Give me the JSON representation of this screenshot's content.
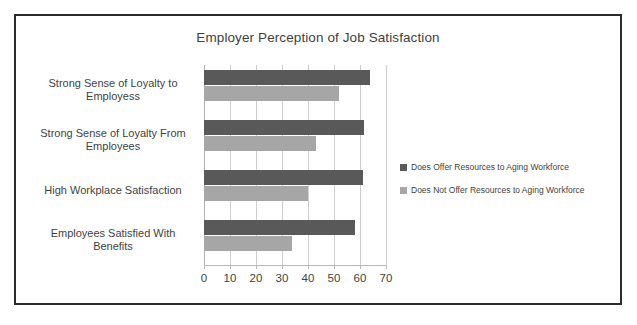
{
  "chart_data": {
    "type": "bar",
    "orientation": "horizontal",
    "title": "Employer Perception of Job Satisfaction",
    "xlabel": "",
    "ylabel": "",
    "xlim": [
      0,
      70
    ],
    "xticks": [
      "0",
      "10",
      "20",
      "30",
      "40",
      "50",
      "60",
      "70"
    ],
    "grid": true,
    "legend_position": "right",
    "categories": [
      "Strong Sense of Loyalty to Employess",
      "Strong Sense of Loyalty From Employees",
      "High Workplace Satisfaction",
      "Employees Satisfied With Benefits"
    ],
    "category_lines": [
      [
        "Strong Sense of Loyalty to",
        "Employess"
      ],
      [
        "Strong Sense of Loyalty From",
        "Employees"
      ],
      [
        "High Workplace Satisfaction"
      ],
      [
        "Employees Satisfied With",
        "Benefits"
      ]
    ],
    "series": [
      {
        "name": "Does Offer Resources to Aging Workforce",
        "color": "#595959",
        "values": [
          64,
          61.5,
          61,
          58
        ]
      },
      {
        "name": "Does Not Offer Resources to Aging Workforce",
        "color": "#a6a6a6",
        "values": [
          52,
          43,
          40,
          34
        ]
      }
    ]
  },
  "colors": {
    "series_dark": "#595959",
    "series_light": "#a6a6a6",
    "border": "#2b2b2b",
    "gridline": "#cfcfcf",
    "text": "#3f3f3f",
    "background": "#ffffff"
  }
}
